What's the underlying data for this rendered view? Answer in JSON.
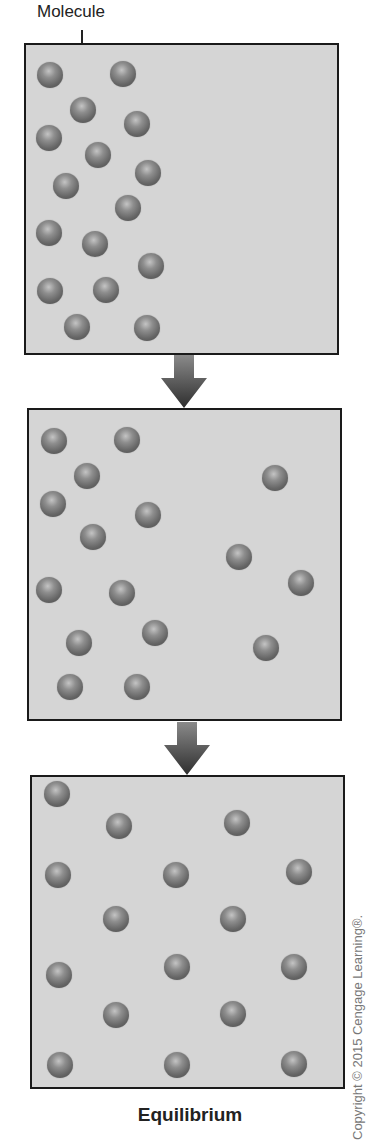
{
  "labels": {
    "molecule": "Molecule",
    "caption": "Equilibrium",
    "copyright": "Copyright © 2015 Cengage Learning®."
  },
  "colors": {
    "panel_background": "#d5d5d5",
    "panel_border": "#1a1a1a",
    "molecule_dark": "#4a4a4a",
    "molecule_light": "#c4c4c4",
    "arrow_top": "#8a8a8a",
    "arrow_bottom": "#2e2e2e"
  },
  "panels": [
    {
      "name": "initial-state",
      "box": {
        "x": 24,
        "y": 43,
        "w": 315,
        "h": 312
      },
      "molecules": [
        [
          50,
          75
        ],
        [
          123,
          74
        ],
        [
          83,
          110
        ],
        [
          137,
          124
        ],
        [
          49,
          138
        ],
        [
          98,
          155
        ],
        [
          148,
          173
        ],
        [
          66,
          186
        ],
        [
          128,
          208
        ],
        [
          49,
          233
        ],
        [
          95,
          244
        ],
        [
          151,
          266
        ],
        [
          50,
          291
        ],
        [
          106,
          290
        ],
        [
          77,
          327
        ],
        [
          147,
          328
        ]
      ]
    },
    {
      "name": "diffusing-state",
      "box": {
        "x": 27,
        "y": 408,
        "w": 315,
        "h": 313
      },
      "molecules": [
        [
          54,
          441
        ],
        [
          127,
          440
        ],
        [
          87,
          476
        ],
        [
          53,
          504
        ],
        [
          148,
          515
        ],
        [
          93,
          537
        ],
        [
          275,
          478
        ],
        [
          239,
          557
        ],
        [
          301,
          583
        ],
        [
          266,
          648
        ],
        [
          49,
          590
        ],
        [
          122,
          593
        ],
        [
          155,
          633
        ],
        [
          79,
          643
        ],
        [
          70,
          687
        ],
        [
          137,
          687
        ]
      ]
    },
    {
      "name": "equilibrium-state",
      "box": {
        "x": 30,
        "y": 775,
        "w": 315,
        "h": 314
      },
      "molecules": [
        [
          57,
          794
        ],
        [
          119,
          826
        ],
        [
          237,
          823
        ],
        [
          58,
          875
        ],
        [
          176,
          875
        ],
        [
          299,
          872
        ],
        [
          116,
          919
        ],
        [
          233,
          919
        ],
        [
          59,
          975
        ],
        [
          177,
          967
        ],
        [
          294,
          967
        ],
        [
          116,
          1015
        ],
        [
          233,
          1014
        ],
        [
          60,
          1065
        ],
        [
          177,
          1065
        ],
        [
          294,
          1064
        ]
      ]
    }
  ],
  "arrows": [
    {
      "name": "arrow-1",
      "x": 160,
      "y": 355
    },
    {
      "name": "arrow-2",
      "x": 163,
      "y": 722
    }
  ]
}
